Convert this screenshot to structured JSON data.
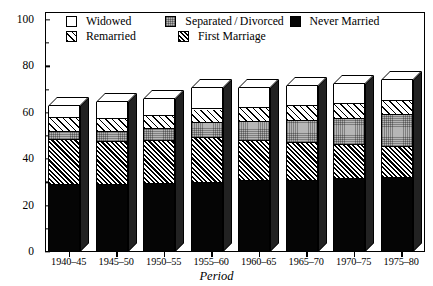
{
  "chart_data": {
    "type": "bar",
    "stacked": true,
    "title": "",
    "xlabel": "Period",
    "ylabel": "Years of Life",
    "ylim": [
      0,
      100
    ],
    "yticks": [
      0,
      20,
      40,
      60,
      80,
      100
    ],
    "ytick_labels": [
      "0",
      "20",
      "40",
      "60",
      "80",
      "100"
    ],
    "minor_yticks": [
      10,
      30,
      50,
      70,
      90
    ],
    "grid": false,
    "legend_position": "top-inside",
    "categories": [
      "1940–45",
      "1945–50",
      "1950–55",
      "1955–60",
      "1960–65",
      "1965–70",
      "1970–75",
      "1975–80"
    ],
    "series": [
      {
        "name": "Never Married",
        "key": "never",
        "swatch": "solid-black",
        "values": [
          28.5,
          28.5,
          29.0,
          29.5,
          30.0,
          30.0,
          31.0,
          31.5
        ]
      },
      {
        "name": "First Marriage",
        "key": "firstmar",
        "swatch": "dense-diagonal-hatch",
        "values": [
          19.5,
          18.5,
          18.5,
          19.0,
          17.5,
          16.5,
          14.5,
          13.5
        ]
      },
      {
        "name": "Separated/Divorced",
        "key": "sepdiv",
        "swatch": "gray-stipple",
        "values": [
          3.5,
          4.5,
          5.0,
          6.5,
          8.0,
          9.5,
          11.5,
          13.5
        ]
      },
      {
        "name": "Remarried",
        "key": "remarried",
        "swatch": "light-diagonal-hatch",
        "values": [
          6.0,
          5.5,
          5.5,
          6.0,
          6.0,
          6.5,
          6.5,
          6.0
        ]
      },
      {
        "name": "Widowed",
        "key": "widowed",
        "swatch": "white-open",
        "values": [
          5.5,
          7.5,
          8.0,
          9.5,
          9.0,
          9.0,
          9.0,
          9.5
        ]
      }
    ],
    "totals": [
      63.0,
      64.5,
      66.0,
      70.5,
      70.5,
      71.5,
      72.5,
      74.0
    ]
  },
  "legend": {
    "rows": [
      [
        {
          "label": "Widowed",
          "swatch": "white-open"
        },
        {
          "label": "Separated / Divorced",
          "swatch": "gray-stipple"
        },
        {
          "label": "Never Married",
          "swatch": "solid-black"
        }
      ],
      [
        {
          "label": "Remarried",
          "swatch": "light-diagonal-hatch"
        },
        {
          "label": "First Marriage",
          "swatch": "dense-diagonal-hatch"
        }
      ]
    ]
  }
}
